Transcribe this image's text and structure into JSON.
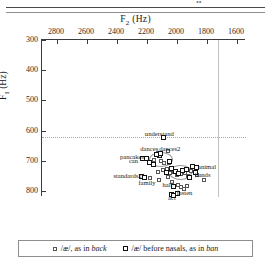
{
  "page": {
    "header_fragment": "••"
  },
  "chart_data": {
    "type": "scatter",
    "title": "",
    "xlabel": "F2 (Hz)",
    "ylabel": "F1 (Hz)",
    "xlim": [
      2900,
      1540
    ],
    "ylim": [
      820,
      300
    ],
    "x_reversed": true,
    "y_reversed": true,
    "xticks": [
      2800,
      2600,
      2400,
      2200,
      2000,
      1800,
      1600
    ],
    "yticks": [
      300,
      400,
      500,
      600,
      700,
      800
    ],
    "grid": false,
    "legend_position": "bottom",
    "reference_lines": [
      {
        "orient": "horizontal",
        "value": 622,
        "style": "dotted"
      },
      {
        "orient": "vertical",
        "value": 1725,
        "style": "solid"
      }
    ],
    "ellipses": [
      {
        "cx": 2115,
        "cy": 693,
        "rx": 75,
        "ry": 22,
        "label": "back-cluster"
      },
      {
        "cx": 1985,
        "cy": 736,
        "rx": 70,
        "ry": 22,
        "label": "nasal-cluster"
      }
    ],
    "series": [
      {
        "name": "/æ/, as in back",
        "marker": "open-square",
        "points": [
          {
            "x": 2218,
            "y": 690,
            "label": "pancakes"
          },
          {
            "x": 2128,
            "y": 674,
            "label": "dances"
          },
          {
            "x": 2060,
            "y": 669,
            "label": "dances2"
          },
          {
            "x": 2155,
            "y": 698,
            "label": ""
          },
          {
            "x": 2108,
            "y": 700,
            "label": ""
          },
          {
            "x": 2085,
            "y": 709,
            "label": ""
          },
          {
            "x": 2055,
            "y": 707,
            "label": ""
          },
          {
            "x": 2128,
            "y": 737,
            "label": ""
          },
          {
            "x": 2095,
            "y": 731,
            "label": ""
          },
          {
            "x": 2070,
            "y": 728,
            "label": ""
          },
          {
            "x": 2045,
            "y": 742,
            "label": ""
          },
          {
            "x": 2020,
            "y": 738,
            "label": ""
          },
          {
            "x": 2000,
            "y": 748,
            "label": ""
          },
          {
            "x": 1975,
            "y": 744,
            "label": ""
          },
          {
            "x": 1950,
            "y": 741,
            "label": ""
          },
          {
            "x": 1930,
            "y": 752,
            "label": ""
          },
          {
            "x": 1910,
            "y": 733,
            "label": ""
          },
          {
            "x": 1890,
            "y": 729,
            "label": ""
          },
          {
            "x": 1865,
            "y": 746,
            "label": "hands"
          },
          {
            "x": 1818,
            "y": 765,
            "label": ""
          },
          {
            "x": 2118,
            "y": 765,
            "label": "family"
          },
          {
            "x": 2035,
            "y": 770,
            "label": "half"
          },
          {
            "x": 1995,
            "y": 779,
            "label": ""
          },
          {
            "x": 1975,
            "y": 787,
            "label": ""
          },
          {
            "x": 1952,
            "y": 795,
            "label": ""
          },
          {
            "x": 1935,
            "y": 782,
            "label": ""
          },
          {
            "x": 2002,
            "y": 806,
            "label": ""
          },
          {
            "x": 2180,
            "y": 758,
            "label": ""
          },
          {
            "x": 2060,
            "y": 755,
            "label": ""
          }
        ]
      },
      {
        "name": "/æ/ before nasals, as in ban",
        "marker": "filled-square",
        "points": [
          {
            "x": 2092,
            "y": 623,
            "label": "understand"
          },
          {
            "x": 2120,
            "y": 684,
            "label": ""
          },
          {
            "x": 2205,
            "y": 692,
            "label": ""
          },
          {
            "x": 2230,
            "y": 691,
            "label": "can"
          },
          {
            "x": 2186,
            "y": 705,
            "label": ""
          },
          {
            "x": 2160,
            "y": 712,
            "label": ""
          },
          {
            "x": 2140,
            "y": 679,
            "label": ""
          },
          {
            "x": 2110,
            "y": 676,
            "label": ""
          },
          {
            "x": 2238,
            "y": 751,
            "label": "standards2"
          },
          {
            "x": 2215,
            "y": 754,
            "label": ""
          },
          {
            "x": 2035,
            "y": 726,
            "label": ""
          },
          {
            "x": 2010,
            "y": 735,
            "label": ""
          },
          {
            "x": 1990,
            "y": 742,
            "label": ""
          },
          {
            "x": 1965,
            "y": 733,
            "label": ""
          },
          {
            "x": 1940,
            "y": 729,
            "label": ""
          },
          {
            "x": 1872,
            "y": 722,
            "label": "animal"
          },
          {
            "x": 1897,
            "y": 718,
            "label": ""
          },
          {
            "x": 1880,
            "y": 738,
            "label": ""
          },
          {
            "x": 1917,
            "y": 757,
            "label": ""
          },
          {
            "x": 2022,
            "y": 785,
            "label": ""
          },
          {
            "x": 2040,
            "y": 812,
            "label": "act"
          },
          {
            "x": 2022,
            "y": 815,
            "label": ""
          },
          {
            "x": 1998,
            "y": 810,
            "label": "fasten"
          },
          {
            "x": 2068,
            "y": 740,
            "label": ""
          },
          {
            "x": 2048,
            "y": 703,
            "label": ""
          }
        ]
      }
    ],
    "point_labels": [
      {
        "text": "understand",
        "x": 2118,
        "y": 612,
        "anchor": "center"
      },
      {
        "text": "dances",
        "x": 2185,
        "y": 660,
        "anchor": "center"
      },
      {
        "text": "dances2",
        "x": 2048,
        "y": 660,
        "anchor": "center"
      },
      {
        "text": "pancakes",
        "x": 2300,
        "y": 688,
        "anchor": "center"
      },
      {
        "text": "can",
        "x": 2290,
        "y": 702,
        "anchor": "center"
      },
      {
        "text": "standards2",
        "x": 2330,
        "y": 750,
        "anchor": "center"
      },
      {
        "text": "family",
        "x": 2200,
        "y": 772,
        "anchor": "center"
      },
      {
        "text": "half",
        "x": 2062,
        "y": 781,
        "anchor": "center"
      },
      {
        "text": "act",
        "x": 2034,
        "y": 822,
        "anchor": "center"
      },
      {
        "text": "fasten",
        "x": 1950,
        "y": 808,
        "anchor": "center"
      },
      {
        "text": "animal",
        "x": 1800,
        "y": 722,
        "anchor": "center"
      },
      {
        "text": "hands",
        "x": 1828,
        "y": 748,
        "anchor": "center"
      }
    ]
  },
  "legend": {
    "items": [
      {
        "marker": "open-square",
        "pre": "/æ/, as in ",
        "italic": "back"
      },
      {
        "marker": "filled-square",
        "pre": "/æ/ before nasals, as in ",
        "italic": "ban"
      }
    ]
  }
}
